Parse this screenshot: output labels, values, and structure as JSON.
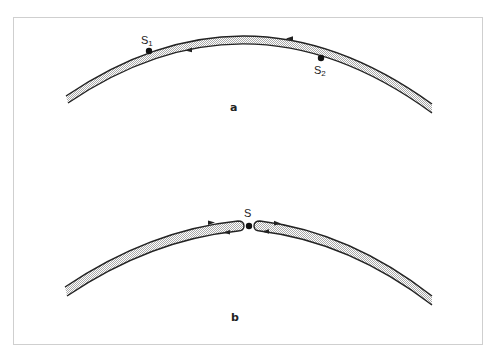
{
  "figure": {
    "panels": [
      {
        "id": "a",
        "label": "a",
        "points": [
          {
            "name": "S",
            "subscript": "1"
          },
          {
            "name": "S",
            "subscript": "2"
          }
        ]
      },
      {
        "id": "b",
        "label": "b",
        "points": [
          {
            "name": "S",
            "subscript": ""
          }
        ]
      }
    ],
    "colors": {
      "stroke": "#222222",
      "fill_stipple": "#bdbdbd",
      "frame": "#cfcfcf",
      "background": "#ffffff"
    }
  }
}
